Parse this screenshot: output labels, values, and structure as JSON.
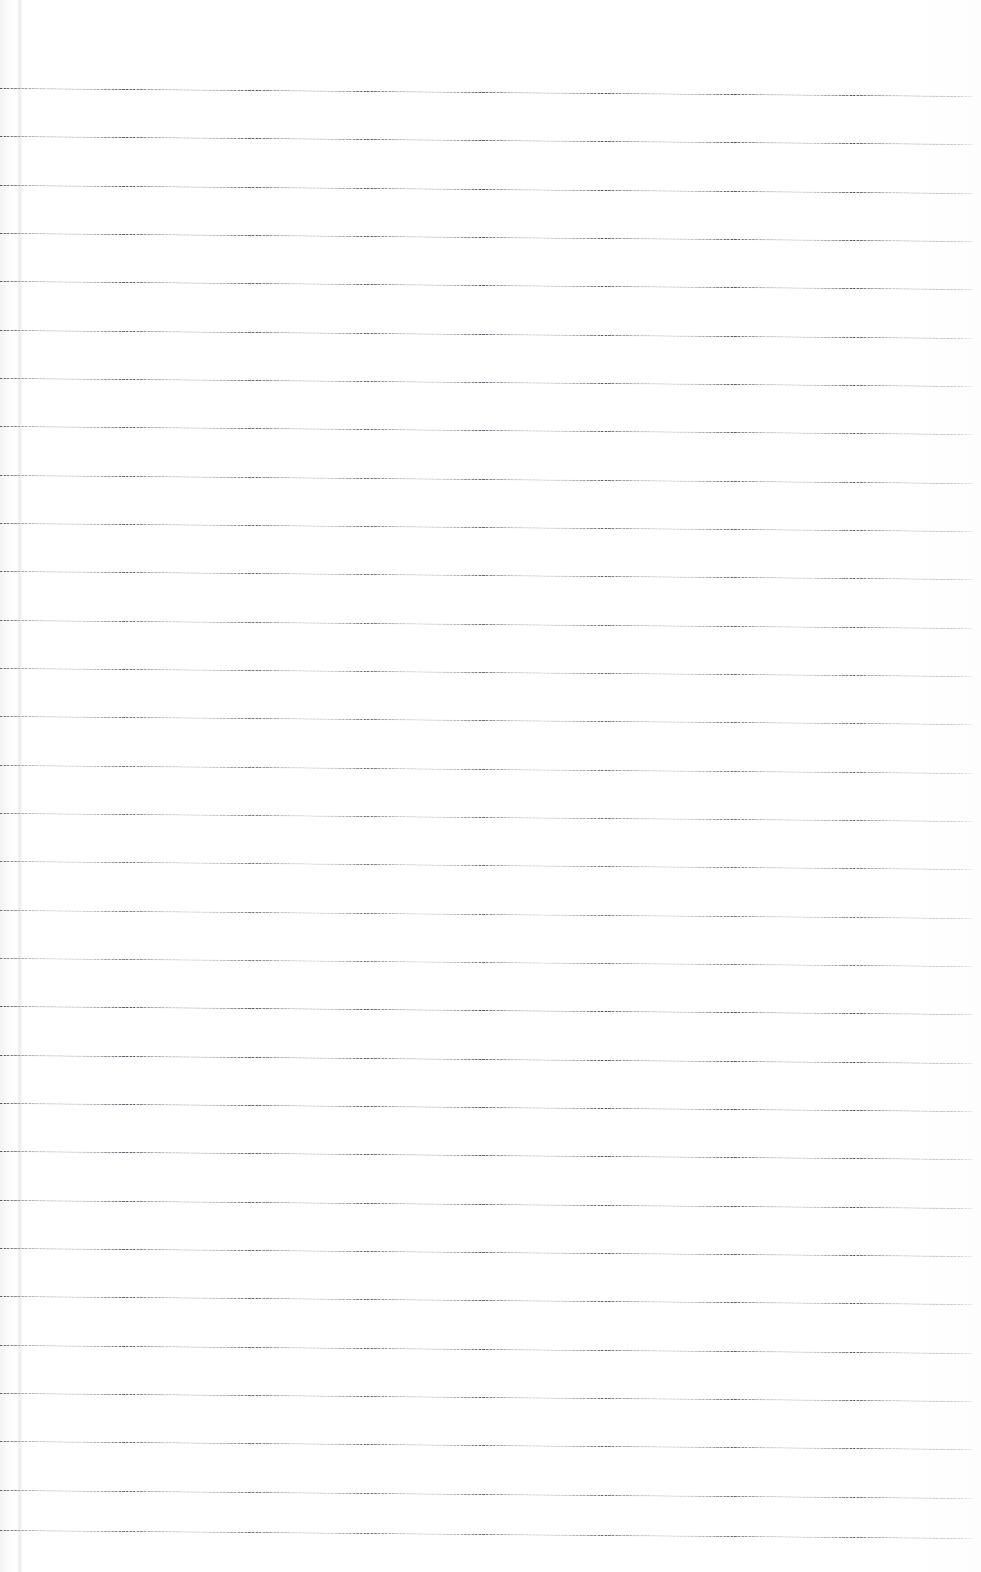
{
  "document": {
    "kind": "scanned-lined-notebook-page",
    "title": "Blank Ruled Notebook Page",
    "page_width": 981,
    "page_height": 1572,
    "background_color": "#ffffff",
    "content_text": "",
    "has_handwriting": false,
    "has_printed_text": false
  },
  "paper": {
    "surface_color": "#ffffff",
    "edge_shadow_color": "#e8e8ea",
    "left_margin_crease_x": 17,
    "left_margin_crease_width": 7,
    "top_margin_px": 88,
    "bottom_margin_px": 42
  },
  "ruling": {
    "style": "wide-ruled horizontal lines",
    "line_color": "#52525b",
    "line_thickness_px": 1,
    "line_spacing_px": 48.3,
    "first_line_y": 88,
    "last_line_y": 1530,
    "line_count": 30,
    "line_start_x": 0,
    "line_end_x": 976,
    "skew_degrees": 0.47,
    "skew_drop_px": 8,
    "lines": [
      {
        "index": 1,
        "y": 88
      },
      {
        "index": 2,
        "y": 136
      },
      {
        "index": 3,
        "y": 185
      },
      {
        "index": 4,
        "y": 233
      },
      {
        "index": 5,
        "y": 281
      },
      {
        "index": 6,
        "y": 330
      },
      {
        "index": 7,
        "y": 378
      },
      {
        "index": 8,
        "y": 426
      },
      {
        "index": 9,
        "y": 475
      },
      {
        "index": 10,
        "y": 523
      },
      {
        "index": 11,
        "y": 571
      },
      {
        "index": 12,
        "y": 620
      },
      {
        "index": 13,
        "y": 668
      },
      {
        "index": 14,
        "y": 716
      },
      {
        "index": 15,
        "y": 765
      },
      {
        "index": 16,
        "y": 813
      },
      {
        "index": 17,
        "y": 861
      },
      {
        "index": 18,
        "y": 910
      },
      {
        "index": 19,
        "y": 958
      },
      {
        "index": 20,
        "y": 1006
      },
      {
        "index": 21,
        "y": 1055
      },
      {
        "index": 22,
        "y": 1103
      },
      {
        "index": 23,
        "y": 1151
      },
      {
        "index": 24,
        "y": 1200
      },
      {
        "index": 25,
        "y": 1248
      },
      {
        "index": 26,
        "y": 1296
      },
      {
        "index": 27,
        "y": 1345
      },
      {
        "index": 28,
        "y": 1393
      },
      {
        "index": 29,
        "y": 1441
      },
      {
        "index": 30,
        "y": 1490
      },
      {
        "index": 31,
        "y": 1530
      }
    ]
  }
}
